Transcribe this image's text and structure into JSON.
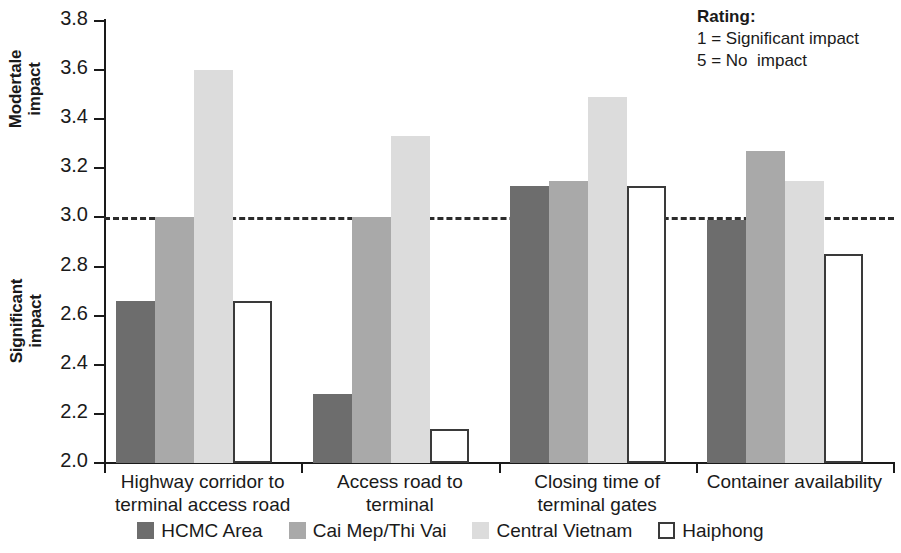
{
  "chart_data": {
    "type": "bar",
    "title": "",
    "xlabel": "",
    "ylabel": "",
    "ylim": [
      2.0,
      3.8
    ],
    "ytick_labels": [
      "3.8",
      "3.6",
      "3.4",
      "3.2",
      "3.0",
      "2.8",
      "2.6",
      "2.4",
      "2.2",
      "2.0"
    ],
    "ytick_values": [
      3.8,
      3.6,
      3.4,
      3.2,
      3.0,
      2.8,
      2.6,
      2.4,
      2.2,
      2.0
    ],
    "grid": false,
    "legend_position": "bottom",
    "reference_line": {
      "value": 3.0,
      "style": "dashed"
    },
    "axis_group_labels": {
      "upper": "Modertale\nimpact",
      "lower": "Significant\nimpact"
    },
    "categories": [
      "Highway corridor to\nterminal access road",
      "Access road to\nterminal",
      "Closing time of\nterminal gates",
      "Container availability"
    ],
    "series": [
      {
        "name": "HCMC Area",
        "color": "#6d6d6d",
        "values": [
          2.66,
          2.28,
          3.13,
          2.99
        ]
      },
      {
        "name": "Cai Mep/Thi Vai",
        "color": "#a9a9a9",
        "values": [
          3.0,
          3.0,
          3.15,
          3.27
        ]
      },
      {
        "name": "Central Vietnam",
        "color": "#dcdcdc",
        "values": [
          3.6,
          3.33,
          3.49,
          3.15
        ]
      },
      {
        "name": "Haiphong",
        "color": "#ffffff",
        "outlined": true,
        "values": [
          2.66,
          2.14,
          3.13,
          2.85
        ]
      }
    ],
    "annotation": {
      "title": "Rating:",
      "lines": [
        "1 = Significant impact",
        "5 = No  impact"
      ]
    }
  }
}
